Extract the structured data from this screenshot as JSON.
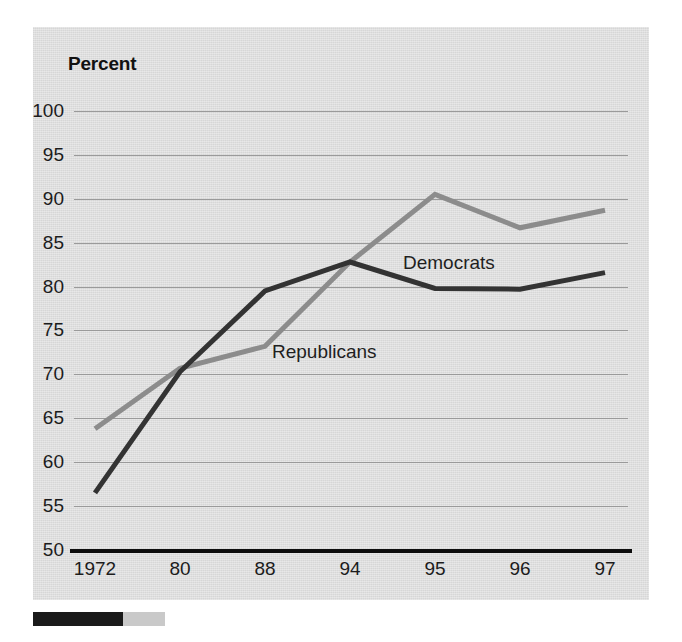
{
  "chart_data": {
    "type": "line",
    "title": "Percent",
    "xlabel": "",
    "ylabel": "Percent",
    "categories": [
      "1972",
      "80",
      "88",
      "94",
      "95",
      "96",
      "97"
    ],
    "ylim": [
      50,
      100
    ],
    "yticks": [
      50,
      55,
      60,
      65,
      70,
      75,
      80,
      85,
      90,
      95,
      100
    ],
    "grid": true,
    "legend_position": "inline-annotations",
    "series": [
      {
        "name": "Democrats",
        "color": "#333333",
        "values": [
          56.5,
          70.3,
          79.5,
          82.8,
          79.8,
          79.7,
          81.6
        ]
      },
      {
        "name": "Republicans",
        "color": "#8c8c8c",
        "values": [
          63.8,
          70.7,
          73.2,
          82.8,
          90.5,
          86.7,
          88.7
        ]
      }
    ],
    "annotations": [
      {
        "text": "Democrats",
        "series": "Democrats"
      },
      {
        "text": "Republicans",
        "series": "Republicans"
      }
    ]
  },
  "colors": {
    "plate_background": "#dedede",
    "gridline": "#9a9a9a",
    "axis": "#0d0d0d",
    "democrats_line": "#333333",
    "republicans_line": "#8c8c8c",
    "text": "#1c1c1c"
  }
}
